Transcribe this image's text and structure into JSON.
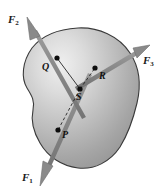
{
  "figure": {
    "type": "physics-free-body-diagram",
    "background_color": "#ffffff",
    "body": {
      "name": "rigid-body-blob",
      "fill_light": "#e2e2e2",
      "fill_mid": "#b8b8b8",
      "fill_dark": "#8f8f8f",
      "outline_color": "#3a3a3a"
    },
    "arrow_color": "#8a8a8a",
    "arrow_outline_color": "#6f6f6f",
    "dashed_line_color": "#1a1a1a",
    "dot_color": "#0d0d0d",
    "forces": [
      {
        "id": "F1",
        "label_text": "F",
        "label_sub": "1",
        "application_point": "P",
        "direction": "down-left",
        "tail_x": 90,
        "tail_y": 74,
        "tip_x": 40,
        "tip_y": 186
      },
      {
        "id": "F2",
        "label_text": "F",
        "label_sub": "2",
        "application_point": "Q",
        "direction": "up-left",
        "tail_x": 84,
        "tail_y": 118,
        "tip_x": 27,
        "tip_y": 17
      },
      {
        "id": "F3",
        "label_text": "F",
        "label_sub": "3",
        "application_point": "R",
        "direction": "up-right",
        "tail_x": 76,
        "tail_y": 89,
        "tip_x": 150,
        "tip_y": 45
      }
    ],
    "points": [
      {
        "id": "P",
        "label": "P",
        "x": 58,
        "y": 130
      },
      {
        "id": "Q",
        "label": "Q",
        "x": 57,
        "y": 58
      },
      {
        "id": "R",
        "label": "R",
        "x": 95,
        "y": 68
      },
      {
        "id": "S",
        "label": "S",
        "x": 80,
        "y": 89
      }
    ],
    "connectors": [
      {
        "from": "S",
        "to": "P",
        "style": "dashed"
      },
      {
        "from": "S",
        "to": "Q",
        "style": "solid"
      },
      {
        "from": "S",
        "to": "R",
        "style": "dashed"
      }
    ]
  }
}
